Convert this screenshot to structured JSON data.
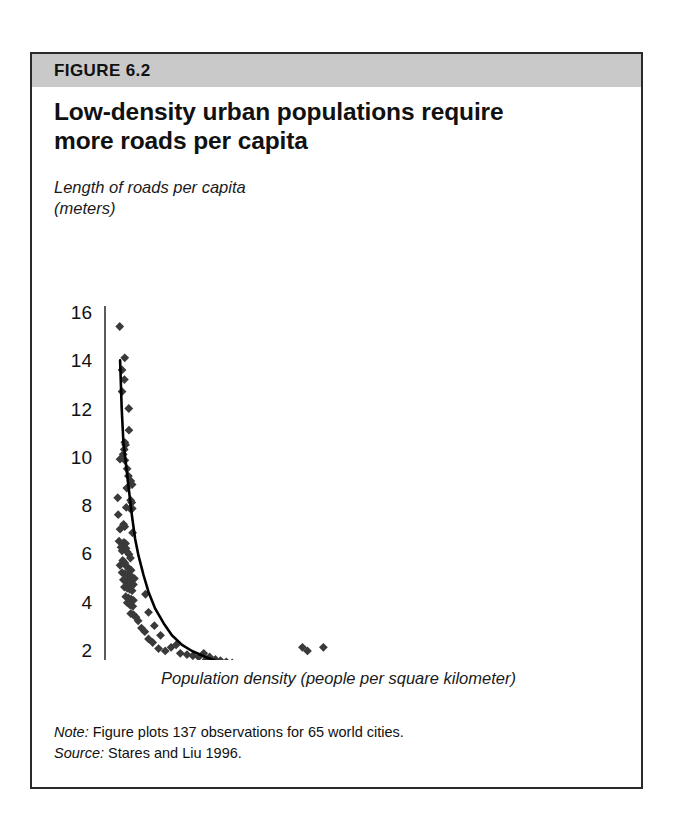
{
  "figure": {
    "label": "FIGURE 6.2",
    "title_line1": "Low-density urban populations require",
    "title_line2": "more roads per capita",
    "note_lead": "Note:",
    "note_text": " Figure plots 137 observations for 65 world cities.",
    "source_lead": "Source:",
    "source_text": " Stares and Liu 1996.",
    "band_color": "#c9c9c9",
    "border_color": "#2a2a2a",
    "marker_color": "#3a3a3a",
    "curve_color": "#000000"
  },
  "chart_data": {
    "type": "scatter",
    "title": "Low-density urban populations require more roads per capita",
    "xlabel": "Population density (people per square kilometer)",
    "ylabel_line1": "Length of roads per capita",
    "ylabel_line2": "(meters)",
    "xlim": [
      0,
      30000
    ],
    "ylim": [
      0,
      16
    ],
    "xticks": [
      0,
      5000,
      10000,
      15000,
      20000,
      25000,
      30000
    ],
    "xticklabels": [
      "0",
      "5,000",
      "10,000",
      "15,000",
      "20,000",
      "25,000",
      "30,000"
    ],
    "yticks": [
      0,
      2,
      4,
      6,
      8,
      10,
      12,
      14,
      16
    ],
    "yticklabels": [
      "0",
      "2",
      "4",
      "6",
      "8",
      "10",
      "12",
      "14",
      "16"
    ],
    "grid": false,
    "legend": null,
    "n_observations": 137,
    "n_cities": 65,
    "marker": "diamond",
    "points": [
      [
        880,
        15.4
      ],
      [
        1180,
        14.1
      ],
      [
        1020,
        13.6
      ],
      [
        1160,
        13.2
      ],
      [
        1020,
        12.7
      ],
      [
        1420,
        12.0
      ],
      [
        1430,
        11.1
      ],
      [
        1180,
        10.6
      ],
      [
        1230,
        10.5
      ],
      [
        1150,
        10.3
      ],
      [
        1090,
        10.1
      ],
      [
        900,
        9.9
      ],
      [
        1190,
        9.85
      ],
      [
        1320,
        9.5
      ],
      [
        1400,
        9.2
      ],
      [
        1540,
        9.0
      ],
      [
        1620,
        8.85
      ],
      [
        1300,
        8.7
      ],
      [
        760,
        8.3
      ],
      [
        1530,
        8.2
      ],
      [
        1600,
        8.1
      ],
      [
        1270,
        7.9
      ],
      [
        1500,
        7.85
      ],
      [
        1630,
        7.85
      ],
      [
        790,
        7.6
      ],
      [
        1110,
        7.2
      ],
      [
        1180,
        7.1
      ],
      [
        900,
        7.0
      ],
      [
        1650,
        6.85
      ],
      [
        840,
        6.5
      ],
      [
        1130,
        6.45
      ],
      [
        1230,
        6.4
      ],
      [
        960,
        6.25
      ],
      [
        1260,
        6.2
      ],
      [
        1020,
        6.1
      ],
      [
        1330,
        6.05
      ],
      [
        1440,
        5.95
      ],
      [
        1520,
        5.8
      ],
      [
        1060,
        5.7
      ],
      [
        1190,
        5.6
      ],
      [
        900,
        5.5
      ],
      [
        1300,
        5.45
      ],
      [
        1450,
        5.35
      ],
      [
        1560,
        5.3
      ],
      [
        1020,
        5.2
      ],
      [
        1180,
        5.15
      ],
      [
        1350,
        5.1
      ],
      [
        1500,
        5.05
      ],
      [
        1640,
        5.0
      ],
      [
        1760,
        4.95
      ],
      [
        1100,
        4.9
      ],
      [
        1280,
        4.85
      ],
      [
        1430,
        4.8
      ],
      [
        1570,
        4.75
      ],
      [
        1700,
        4.7
      ],
      [
        1160,
        4.6
      ],
      [
        1330,
        4.55
      ],
      [
        1480,
        4.5
      ],
      [
        1620,
        4.45
      ],
      [
        2420,
        4.3
      ],
      [
        1240,
        4.2
      ],
      [
        1400,
        4.15
      ],
      [
        1560,
        4.1
      ],
      [
        1700,
        4.05
      ],
      [
        1330,
        3.95
      ],
      [
        1500,
        3.85
      ],
      [
        1660,
        3.8
      ],
      [
        2600,
        3.55
      ],
      [
        1540,
        3.5
      ],
      [
        1700,
        3.45
      ],
      [
        1850,
        3.35
      ],
      [
        1980,
        3.2
      ],
      [
        2950,
        3.0
      ],
      [
        2180,
        2.9
      ],
      [
        2380,
        2.75
      ],
      [
        3320,
        2.6
      ],
      [
        2600,
        2.45
      ],
      [
        2850,
        2.3
      ],
      [
        4250,
        2.2
      ],
      [
        3950,
        2.1
      ],
      [
        3200,
        2.05
      ],
      [
        3600,
        1.95
      ],
      [
        11800,
        2.1
      ],
      [
        13050,
        2.1
      ],
      [
        12100,
        1.95
      ],
      [
        4500,
        1.85
      ],
      [
        4900,
        1.8
      ],
      [
        5250,
        1.75
      ],
      [
        5600,
        1.7
      ],
      [
        5900,
        1.85
      ],
      [
        6250,
        1.7
      ],
      [
        6050,
        1.6
      ],
      [
        6600,
        1.6
      ],
      [
        6900,
        1.55
      ],
      [
        7250,
        1.5
      ],
      [
        6400,
        1.45
      ],
      [
        7600,
        1.45
      ],
      [
        7000,
        1.4
      ],
      [
        7900,
        1.4
      ],
      [
        8250,
        1.35
      ],
      [
        7500,
        1.3
      ],
      [
        8600,
        1.3
      ],
      [
        8000,
        1.25
      ],
      [
        9000,
        1.2
      ],
      [
        8400,
        1.15
      ],
      [
        9400,
        1.15
      ],
      [
        9800,
        1.1
      ],
      [
        10300,
        1.05
      ],
      [
        9100,
        1.0
      ],
      [
        10800,
        1.0
      ],
      [
        11300,
        0.95
      ],
      [
        13600,
        1.3
      ],
      [
        14500,
        1.3
      ],
      [
        12700,
        1.0
      ],
      [
        13200,
        0.95
      ],
      [
        14200,
        0.9
      ],
      [
        15100,
        0.85
      ],
      [
        15900,
        0.85
      ],
      [
        16600,
        0.8
      ],
      [
        18200,
        1.0
      ],
      [
        17400,
        0.75
      ],
      [
        19900,
        0.65
      ],
      [
        2000,
        1.25
      ],
      [
        2900,
        1.2
      ],
      [
        3350,
        0.75
      ],
      [
        3800,
        0.7
      ],
      [
        4200,
        0.65
      ],
      [
        4700,
        0.6
      ],
      [
        5100,
        0.6
      ],
      [
        5500,
        0.55
      ],
      [
        6000,
        0.5
      ],
      [
        6500,
        0.5
      ],
      [
        7100,
        0.5
      ],
      [
        7600,
        0.45
      ],
      [
        8200,
        0.45
      ],
      [
        8800,
        0.4
      ],
      [
        9500,
        0.4
      ],
      [
        10200,
        0.45
      ],
      [
        11000,
        0.4
      ],
      [
        12000,
        0.35
      ],
      [
        13000,
        0.35
      ],
      [
        20100,
        0.3
      ],
      [
        27200,
        0.35
      ],
      [
        29100,
        0.35
      ]
    ],
    "fit_curve": {
      "description": "Fitted hyperbolic trend: roads per capita declines steeply then flattens",
      "points": [
        [
          900,
          14.0
        ],
        [
          1000,
          12.0
        ],
        [
          1100,
          10.6
        ],
        [
          1200,
          10.0
        ],
        [
          1400,
          8.8
        ],
        [
          1600,
          7.6
        ],
        [
          1800,
          6.6
        ],
        [
          2000,
          5.9
        ],
        [
          2300,
          5.1
        ],
        [
          2600,
          4.4
        ],
        [
          3000,
          3.7
        ],
        [
          3500,
          3.1
        ],
        [
          4000,
          2.6
        ],
        [
          4600,
          2.2
        ],
        [
          5200,
          1.95
        ],
        [
          6000,
          1.7
        ],
        [
          7000,
          1.45
        ],
        [
          8000,
          1.25
        ],
        [
          9000,
          1.1
        ],
        [
          10000,
          1.0
        ],
        [
          11500,
          0.88
        ],
        [
          13000,
          0.8
        ],
        [
          15000,
          0.72
        ],
        [
          17500,
          0.66
        ],
        [
          20000,
          0.6
        ],
        [
          24000,
          0.52
        ],
        [
          27000,
          0.46
        ],
        [
          30000,
          0.4
        ]
      ]
    }
  }
}
